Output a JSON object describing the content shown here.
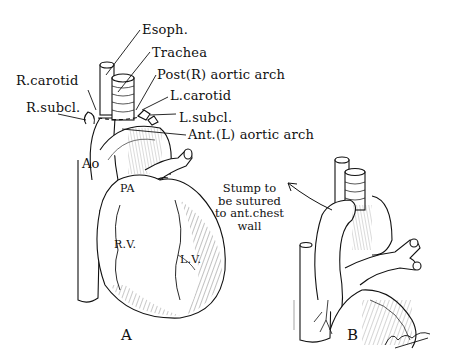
{
  "figure": {
    "panels": [
      {
        "id": "A",
        "letter": "A"
      },
      {
        "id": "B",
        "letter": "B"
      }
    ],
    "labels_A": {
      "esoph": "Esoph.",
      "trachea": "Trachea",
      "post_r_aortic_arch": "Post(R) aortic arch",
      "r_carotid": "R.carotid",
      "l_carotid": "L.carotid",
      "r_subcl": "R.subcl.",
      "l_subcl": "L.subcl.",
      "ant_l_aortic_arch": "Ant.(L) aortic arch",
      "ao": "Ao",
      "pa": "PA",
      "rv": "R.V.",
      "lv": "L.V."
    },
    "labels_B": {
      "stump_note_lines": [
        "Stump to",
        "be sutured",
        "to ant.chest",
        "wall"
      ]
    },
    "colors": {
      "ink": "#111111",
      "paper": "#ffffff"
    }
  }
}
